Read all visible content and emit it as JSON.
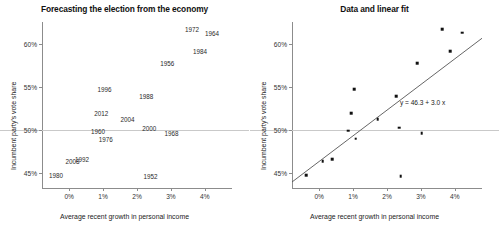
{
  "chart_data": [
    {
      "type": "scatter",
      "panel": "left",
      "title": "Forecasting the election from the economy",
      "xlabel": "Average recent growth in personal income",
      "ylabel": "Incumbent party's vote share",
      "xticks": [
        "0%",
        "1%",
        "2%",
        "3%",
        "4%"
      ],
      "xtickvals": [
        0,
        1,
        2,
        3,
        4
      ],
      "yticks": [
        "45%",
        "50%",
        "55%",
        "60%"
      ],
      "ytickvals": [
        45,
        50,
        55,
        60
      ],
      "xlim": [
        -0.8,
        4.8
      ],
      "ylim": [
        43.2,
        62.6
      ],
      "grid": false,
      "reference_line_y": 50,
      "legend": "none",
      "marker": "text-labels",
      "points": [
        {
          "label": "1952",
          "x": 2.4,
          "y": 44.6
        },
        {
          "label": "1956",
          "x": 2.89,
          "y": 57.76
        },
        {
          "label": "1960",
          "x": 0.85,
          "y": 49.91
        },
        {
          "label": "1964",
          "x": 4.21,
          "y": 61.34
        },
        {
          "label": "1968",
          "x": 3.02,
          "y": 49.6
        },
        {
          "label": "1972",
          "x": 3.62,
          "y": 61.79
        },
        {
          "label": "1976",
          "x": 1.08,
          "y": 48.95
        },
        {
          "label": "1980",
          "x": -0.39,
          "y": 44.7
        },
        {
          "label": "1984",
          "x": 3.86,
          "y": 59.17
        },
        {
          "label": "1988",
          "x": 2.27,
          "y": 53.94
        },
        {
          "label": "1992",
          "x": 0.38,
          "y": 46.55
        },
        {
          "label": "1996",
          "x": 1.04,
          "y": 54.74
        },
        {
          "label": "2000",
          "x": 2.36,
          "y": 50.27
        },
        {
          "label": "2004",
          "x": 1.72,
          "y": 51.24
        },
        {
          "label": "2008",
          "x": 0.1,
          "y": 46.32
        },
        {
          "label": "2012",
          "x": 0.95,
          "y": 51.96
        }
      ]
    },
    {
      "type": "scatter",
      "panel": "right",
      "title": "Data and linear fit",
      "xlabel": "Average recent growth in personal income",
      "ylabel": "Incumbent party's vote share",
      "xticks": [
        "0%",
        "1%",
        "2%",
        "3%",
        "4%"
      ],
      "xtickvals": [
        0,
        1,
        2,
        3,
        4
      ],
      "yticks": [
        "45%",
        "50%",
        "55%",
        "60%"
      ],
      "ytickvals": [
        45,
        50,
        55,
        60
      ],
      "xlim": [
        -0.8,
        4.8
      ],
      "ylim": [
        43.2,
        62.6
      ],
      "grid": false,
      "reference_line_y": 50,
      "legend": "none",
      "marker": "filled-square",
      "annotation": "y = 46.3 + 3.0 x",
      "annotation_x": 3.05,
      "annotation_y": 53.2,
      "fit": {
        "intercept": 46.3,
        "slope": 3.0,
        "equation": "y = 46.3 + 3.0 x"
      },
      "points": [
        {
          "label": "1952",
          "x": 2.4,
          "y": 44.6
        },
        {
          "label": "1956",
          "x": 2.89,
          "y": 57.76
        },
        {
          "label": "1960",
          "x": 0.85,
          "y": 49.91
        },
        {
          "label": "1964",
          "x": 4.21,
          "y": 61.34
        },
        {
          "label": "1968",
          "x": 3.02,
          "y": 49.6
        },
        {
          "label": "1972",
          "x": 3.62,
          "y": 61.79
        },
        {
          "label": "1976",
          "x": 1.08,
          "y": 48.95
        },
        {
          "label": "1980",
          "x": -0.39,
          "y": 44.7
        },
        {
          "label": "1984",
          "x": 3.86,
          "y": 59.17
        },
        {
          "label": "1988",
          "x": 2.27,
          "y": 53.94
        },
        {
          "label": "1992",
          "x": 0.38,
          "y": 46.55
        },
        {
          "label": "1996",
          "x": 1.04,
          "y": 54.74
        },
        {
          "label": "2000",
          "x": 2.36,
          "y": 50.27
        },
        {
          "label": "2004",
          "x": 1.72,
          "y": 51.24
        },
        {
          "label": "2008",
          "x": 0.1,
          "y": 46.32
        },
        {
          "label": "2012",
          "x": 0.95,
          "y": 51.96
        }
      ]
    }
  ],
  "style": {
    "axis_color": "#8c8c8c",
    "reference_line_color": "#c9c9c9",
    "marker_color": "#111111",
    "fit_line_color": "#555555",
    "text_color": "#222222",
    "background": "#ffffff"
  }
}
